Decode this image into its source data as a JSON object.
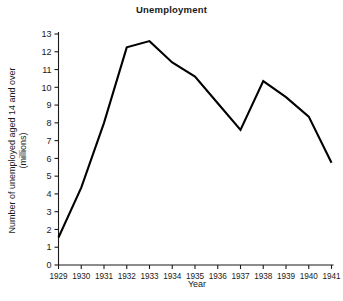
{
  "chart_data": {
    "type": "line",
    "title": "Unemployment",
    "xlabel": "Year",
    "ylabel": "Number of unemployed aged 14 and over (millions)",
    "categories": [
      "1929",
      "1930",
      "1931",
      "1932",
      "1933",
      "1934",
      "1935",
      "1936",
      "1937",
      "1938",
      "1939",
      "1940",
      "1941"
    ],
    "x": [
      1929,
      1930,
      1931,
      1932,
      1933,
      1934,
      1935,
      1936,
      1937,
      1938,
      1939,
      1940,
      1941
    ],
    "values": [
      1.55,
      4.35,
      8.0,
      12.25,
      12.6,
      11.4,
      10.6,
      9.1,
      7.6,
      10.35,
      9.45,
      8.35,
      5.75
    ],
    "series": [
      {
        "name": "Number of unemployed aged 14 and over (millions)",
        "values": [
          1.55,
          4.35,
          8.0,
          12.25,
          12.6,
          11.4,
          10.6,
          9.1,
          7.6,
          10.35,
          9.45,
          8.35,
          5.75
        ]
      }
    ],
    "xlim": [
      1929,
      1941
    ],
    "ylim": [
      0,
      13
    ],
    "ytick_labels": [
      "0",
      "1",
      "2",
      "3",
      "4",
      "5",
      "6",
      "7",
      "8",
      "9",
      "10",
      "11",
      "12",
      "13"
    ],
    "ytick_values": [
      0,
      1,
      2,
      3,
      4,
      5,
      6,
      7,
      8,
      9,
      10,
      11,
      12,
      13
    ],
    "xtick_labels": [
      "1929",
      "1930",
      "1931",
      "1932",
      "1933",
      "1934",
      "1935",
      "1936",
      "1937",
      "1938",
      "1939",
      "1940",
      "1941"
    ],
    "grid": false,
    "legend": false,
    "legend_position": "none",
    "line_color": "#000000",
    "background_color": "#ffffff",
    "axis_color": "#1a1a1a"
  }
}
